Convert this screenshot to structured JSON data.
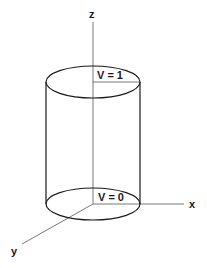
{
  "diagram": {
    "title": "",
    "axes": {
      "z_label": "z",
      "x_label": "x",
      "y_label": "y"
    },
    "cylinder": {
      "top_label": "V = 1",
      "bottom_label": "V = 0"
    },
    "colors": {
      "line": "#1a1a1a",
      "axis": "#555555",
      "background": "#ffffff"
    }
  }
}
